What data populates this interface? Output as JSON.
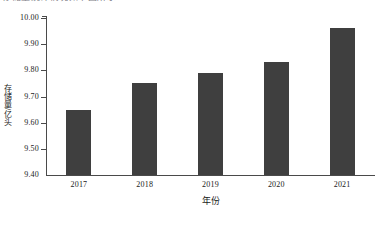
{
  "caption_sliver": "存储量统计情况如下图所示",
  "chart_data": {
    "type": "bar",
    "title": "",
    "xlabel": "年份",
    "ylabel": "存储量/亿头",
    "categories": [
      "2017",
      "2018",
      "2019",
      "2020",
      "2021"
    ],
    "values": [
      9.65,
      9.75,
      9.79,
      9.83,
      9.96
    ],
    "ylim": [
      9.4,
      10.0
    ],
    "ytick_labels": [
      "10.00",
      "9.90",
      "9.80",
      "9.70",
      "9.60",
      "9.50",
      "9.40"
    ],
    "ytick_values": [
      10.0,
      9.9,
      9.8,
      9.7,
      9.6,
      9.5,
      9.4
    ],
    "grid": false,
    "legend": null,
    "bar_color": "#3f3f3f",
    "axis_color": "#4a4a4a",
    "background": "#ffffff"
  }
}
